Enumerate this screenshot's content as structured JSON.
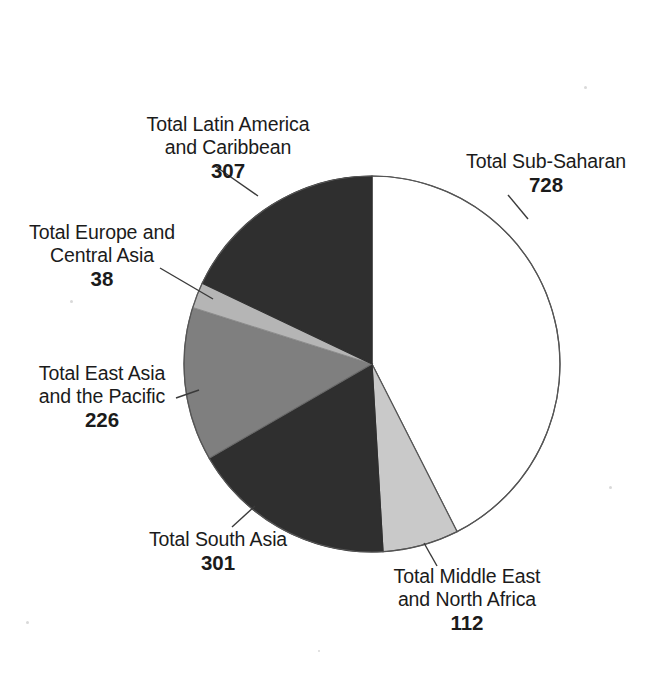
{
  "chart_data": {
    "type": "pie",
    "title": "",
    "subtitle": "",
    "xlabel": "",
    "ylabel": "",
    "legend_position": "none",
    "grid": false,
    "total": 1712,
    "start_angle_deg": 0,
    "direction": "clockwise",
    "categories": [
      "Total Sub-Saharan",
      "Total Middle East and North Africa",
      "Total South Asia",
      "Total East Asia and the Pacific",
      "Total Europe and Central Asia",
      "Total Latin America and Caribbean"
    ],
    "values": [
      728,
      112,
      301,
      226,
      38,
      307
    ],
    "slices": [
      {
        "key": "sub_saharan",
        "label_line1": "Total Sub-Saharan",
        "label_line2": "",
        "value": "728",
        "value_number": 728,
        "color": "#ffffff",
        "stroke": "#555555",
        "percent": "42.5%"
      },
      {
        "key": "middle_east_north_africa",
        "label_line1": "Total Middle East",
        "label_line2": "and North Africa",
        "value": "112",
        "value_number": 112,
        "color": "#c9c9c9",
        "stroke": "#555555",
        "percent": "6.5%"
      },
      {
        "key": "south_asia",
        "label_line1": "Total South Asia",
        "label_line2": "",
        "value": "301",
        "value_number": 301,
        "color": "#2f2f2f",
        "stroke": "#2f2f2f",
        "percent": "17.6%"
      },
      {
        "key": "east_asia_pacific",
        "label_line1": "Total East Asia",
        "label_line2": "and the Pacific",
        "value": "226",
        "value_number": 226,
        "color": "#7f7f7f",
        "stroke": "#6a6a6a",
        "percent": "13.2%"
      },
      {
        "key": "europe_central_asia",
        "label_line1": "Total Europe and",
        "label_line2": "Central Asia",
        "value": "38",
        "value_number": 38,
        "color": "#b5b5b5",
        "stroke": "#8d8d8d",
        "percent": "2.2%"
      },
      {
        "key": "latin_america_caribbean",
        "label_line1": "Total Latin America",
        "label_line2": "and Caribbean",
        "value": "307",
        "value_number": 307,
        "color": "#2f2f2f",
        "stroke": "#2f2f2f",
        "percent": "17.9%"
      }
    ],
    "geometry": {
      "center_x": 372,
      "center_y": 364,
      "radius": 188
    },
    "colors": {
      "dark": "#2f2f2f",
      "mid_gray": "#7f7f7f",
      "light_gray": "#c9c9c9",
      "pale_gray": "#b5b5b5",
      "white": "#ffffff",
      "outline": "#555555",
      "text": "#1b1b1b"
    }
  }
}
